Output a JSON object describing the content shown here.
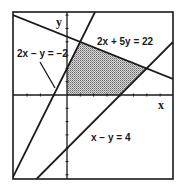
{
  "diagram": {
    "type": "linear-inequality-feasible-region",
    "axes": {
      "x_label": "x",
      "y_label": "y",
      "tick_spacing_units": 1
    },
    "lines": [
      {
        "id": "line-a",
        "equation": "2x + 5y = 22",
        "label": "2x + 5y = 22"
      },
      {
        "id": "line-b",
        "equation": "2x - y = -2",
        "label": "2x − y = −2"
      },
      {
        "id": "line-c",
        "equation": "x - y = 4",
        "label": "x − y = 4"
      }
    ],
    "feasible_region": {
      "shading": "dotted-gray",
      "vertices": [
        [
          0,
          0
        ],
        [
          0,
          2
        ],
        [
          1,
          4
        ],
        [
          6,
          2
        ],
        [
          4,
          0
        ]
      ]
    },
    "colors": {
      "line": "#1a1a1a",
      "shade": "#8a8a8a",
      "background": "#ffffff"
    }
  }
}
